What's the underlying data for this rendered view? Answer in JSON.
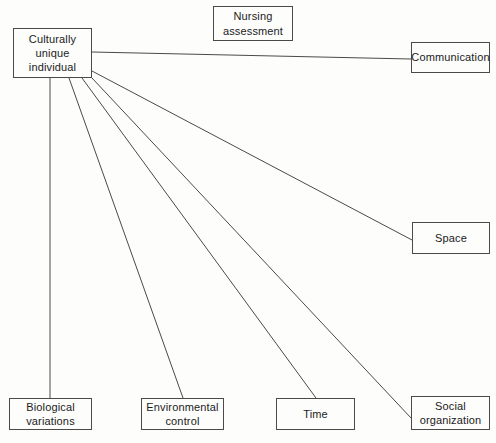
{
  "diagram": {
    "title": "Nursing assessment",
    "type": "node-link diagram",
    "canvas": {
      "width": 496,
      "height": 443,
      "background": "#fdfdfc"
    },
    "style": {
      "line_color": "#4a4a4a",
      "box_border": "#4a4a4a",
      "text_color": "#1b1b1b"
    },
    "nodes": [
      {
        "id": "nursing-assessment",
        "label": "Nursing\nassessment",
        "x": 213,
        "y": 6,
        "w": 80,
        "h": 35
      },
      {
        "id": "culturally-unique-individual",
        "label": "Culturally\nunique\nindividual",
        "x": 13,
        "y": 28,
        "w": 79,
        "h": 50
      },
      {
        "id": "communication",
        "label": "Communication",
        "x": 411,
        "y": 42,
        "w": 79,
        "h": 31
      },
      {
        "id": "space",
        "label": "Space",
        "x": 412,
        "y": 222,
        "w": 78,
        "h": 32
      },
      {
        "id": "biological-variations",
        "label": "Biological\nvariations",
        "x": 9,
        "y": 398,
        "w": 83,
        "h": 32
      },
      {
        "id": "environmental-control",
        "label": "Environmental\ncontrol",
        "x": 141,
        "y": 398,
        "w": 83,
        "h": 32
      },
      {
        "id": "time",
        "label": "Time",
        "x": 276,
        "y": 398,
        "w": 79,
        "h": 32
      },
      {
        "id": "social-organization",
        "label": "Social\norganization",
        "x": 411,
        "y": 396,
        "w": 79,
        "h": 34
      }
    ],
    "edges": [
      {
        "id": "edge-communication",
        "from": "culturally-unique-individual",
        "to": "communication",
        "x1": 92,
        "y1": 52,
        "x2": 411,
        "y2": 59
      },
      {
        "id": "edge-space",
        "from": "culturally-unique-individual",
        "to": "space",
        "x1": 92,
        "y1": 71,
        "x2": 412,
        "y2": 240
      },
      {
        "id": "edge-social-organization",
        "from": "culturally-unique-individual",
        "to": "social-organization",
        "x1": 92,
        "y1": 78,
        "x2": 411,
        "y2": 418
      },
      {
        "id": "edge-time",
        "from": "culturally-unique-individual",
        "to": "time",
        "x1": 82,
        "y1": 78,
        "x2": 316,
        "y2": 398
      },
      {
        "id": "edge-environmental-control",
        "from": "culturally-unique-individual",
        "to": "environmental-control",
        "x1": 69,
        "y1": 78,
        "x2": 183,
        "y2": 398
      },
      {
        "id": "edge-biological-variations",
        "from": "culturally-unique-individual",
        "to": "biological-variations",
        "x1": 50,
        "y1": 78,
        "x2": 50,
        "y2": 398
      }
    ]
  }
}
